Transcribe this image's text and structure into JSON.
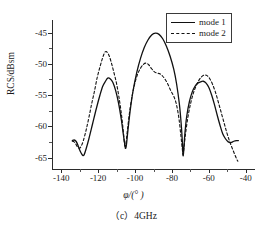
{
  "caption": "（c）4GHz",
  "legend": {
    "position": "top-right",
    "entries": [
      {
        "label": "mode 1",
        "style": "solid"
      },
      {
        "label": "mode 2",
        "style": "dashed"
      }
    ]
  },
  "axes": {
    "x_title": "φ/(° )",
    "y_title": "RCS/dBsm",
    "x_ticks": [
      "-140",
      "-120",
      "-100",
      "-80",
      "-60",
      "-40"
    ],
    "y_ticks": [
      "-45",
      "-50",
      "-55",
      "-60",
      "-65"
    ]
  },
  "chart_data": {
    "type": "line",
    "title": "（c）4GHz",
    "xlabel": "φ/(° )",
    "ylabel": "RCS/dBsm",
    "xlim": [
      -145,
      -35
    ],
    "ylim": [
      -67,
      -43
    ],
    "y_inverted": false,
    "grid": false,
    "legend_position": "top-right",
    "x_ticks": [
      -140,
      -120,
      -100,
      -80,
      -60,
      -40
    ],
    "y_ticks": [
      -45,
      -50,
      -55,
      -60,
      -65
    ],
    "series": [
      {
        "name": "mode 1",
        "style": "solid",
        "color": "#111111",
        "points": [
          [
            -134.0,
            -62.3
          ],
          [
            -133.0,
            -62.2
          ],
          [
            -132.0,
            -62.4
          ],
          [
            -131.0,
            -63.0
          ],
          [
            -130.0,
            -63.8
          ],
          [
            -129.0,
            -64.4
          ],
          [
            -128.2,
            -64.7
          ],
          [
            -127.5,
            -64.5
          ],
          [
            -126.5,
            -63.6
          ],
          [
            -125.0,
            -62.0
          ],
          [
            -123.0,
            -59.6
          ],
          [
            -121.0,
            -57.2
          ],
          [
            -119.0,
            -55.0
          ],
          [
            -117.5,
            -53.6
          ],
          [
            -116.0,
            -52.8
          ],
          [
            -114.8,
            -52.3
          ],
          [
            -113.5,
            -52.4
          ],
          [
            -112.0,
            -53.0
          ],
          [
            -110.5,
            -54.3
          ],
          [
            -109.0,
            -56.2
          ],
          [
            -107.5,
            -58.8
          ],
          [
            -106.3,
            -61.4
          ],
          [
            -105.4,
            -63.2
          ],
          [
            -105.0,
            -63.5
          ],
          [
            -104.6,
            -62.8
          ],
          [
            -103.8,
            -60.5
          ],
          [
            -102.5,
            -57.2
          ],
          [
            -101.0,
            -54.2
          ],
          [
            -99.0,
            -51.3
          ],
          [
            -97.0,
            -49.1
          ],
          [
            -95.0,
            -47.4
          ],
          [
            -93.0,
            -46.2
          ],
          [
            -91.0,
            -45.4
          ],
          [
            -89.0,
            -45.1
          ],
          [
            -87.0,
            -45.3
          ],
          [
            -85.0,
            -46.0
          ],
          [
            -83.0,
            -47.2
          ],
          [
            -81.0,
            -48.8
          ],
          [
            -79.0,
            -50.9
          ],
          [
            -77.5,
            -53.2
          ],
          [
            -76.0,
            -56.4
          ],
          [
            -75.0,
            -59.6
          ],
          [
            -74.3,
            -62.8
          ],
          [
            -74.0,
            -64.7
          ],
          [
            -73.6,
            -63.8
          ],
          [
            -73.0,
            -61.2
          ],
          [
            -72.0,
            -58.4
          ],
          [
            -70.5,
            -56.0
          ],
          [
            -69.0,
            -54.5
          ],
          [
            -67.5,
            -53.6
          ],
          [
            -66.0,
            -53.1
          ],
          [
            -64.5,
            -52.9
          ],
          [
            -63.0,
            -52.8
          ],
          [
            -61.5,
            -53.1
          ],
          [
            -60.0,
            -53.8
          ],
          [
            -58.5,
            -55.0
          ],
          [
            -57.0,
            -56.5
          ],
          [
            -55.5,
            -58.2
          ],
          [
            -54.0,
            -59.8
          ],
          [
            -52.5,
            -61.2
          ],
          [
            -51.0,
            -62.0
          ],
          [
            -49.5,
            -62.5
          ],
          [
            -48.0,
            -62.6
          ],
          [
            -46.5,
            -62.4
          ],
          [
            -45.0,
            -62.3
          ],
          [
            -44.0,
            -62.3
          ]
        ]
      },
      {
        "name": "mode 2",
        "style": "dashed",
        "color": "#111111",
        "points": [
          [
            -134.0,
            -62.4
          ],
          [
            -133.0,
            -62.5
          ],
          [
            -132.0,
            -62.9
          ],
          [
            -131.0,
            -63.4
          ],
          [
            -130.0,
            -63.5
          ],
          [
            -129.2,
            -63.2
          ],
          [
            -128.0,
            -62.3
          ],
          [
            -126.5,
            -60.6
          ],
          [
            -125.0,
            -58.6
          ],
          [
            -123.5,
            -56.4
          ],
          [
            -122.0,
            -54.4
          ],
          [
            -120.5,
            -52.2
          ],
          [
            -119.0,
            -50.5
          ],
          [
            -117.5,
            -49.0
          ],
          [
            -116.2,
            -48.1
          ],
          [
            -115.0,
            -48.2
          ],
          [
            -113.8,
            -48.9
          ],
          [
            -112.5,
            -50.2
          ],
          [
            -111.2,
            -51.7
          ],
          [
            -110.0,
            -53.2
          ],
          [
            -108.8,
            -55.2
          ],
          [
            -107.5,
            -57.8
          ],
          [
            -106.5,
            -60.4
          ],
          [
            -105.8,
            -62.6
          ],
          [
            -105.4,
            -63.5
          ],
          [
            -105.0,
            -62.9
          ],
          [
            -104.2,
            -60.8
          ],
          [
            -103.0,
            -57.8
          ],
          [
            -101.5,
            -55.0
          ],
          [
            -100.0,
            -53.0
          ],
          [
            -98.5,
            -51.6
          ],
          [
            -97.0,
            -50.7
          ],
          [
            -95.5,
            -50.1
          ],
          [
            -94.0,
            -49.9
          ],
          [
            -92.5,
            -50.2
          ],
          [
            -91.0,
            -50.8
          ],
          [
            -89.5,
            -51.3
          ],
          [
            -88.0,
            -51.5
          ],
          [
            -86.5,
            -51.6
          ],
          [
            -85.0,
            -52.0
          ],
          [
            -83.5,
            -52.6
          ],
          [
            -82.0,
            -53.4
          ],
          [
            -80.5,
            -54.4
          ],
          [
            -79.0,
            -55.2
          ],
          [
            -77.5,
            -56.6
          ],
          [
            -76.2,
            -58.8
          ],
          [
            -75.2,
            -61.4
          ],
          [
            -74.4,
            -63.6
          ],
          [
            -74.0,
            -64.5
          ],
          [
            -73.6,
            -63.7
          ],
          [
            -72.8,
            -61.6
          ],
          [
            -71.5,
            -58.8
          ],
          [
            -70.0,
            -56.5
          ],
          [
            -68.5,
            -54.8
          ],
          [
            -67.0,
            -53.6
          ],
          [
            -65.5,
            -52.7
          ],
          [
            -64.0,
            -52.1
          ],
          [
            -62.5,
            -51.8
          ],
          [
            -61.0,
            -51.9
          ],
          [
            -59.5,
            -52.4
          ],
          [
            -58.0,
            -53.3
          ],
          [
            -56.5,
            -54.5
          ],
          [
            -55.0,
            -56.0
          ],
          [
            -53.5,
            -57.6
          ],
          [
            -52.0,
            -59.2
          ],
          [
            -50.5,
            -60.8
          ],
          [
            -49.0,
            -62.2
          ],
          [
            -47.5,
            -63.4
          ],
          [
            -46.0,
            -64.5
          ],
          [
            -45.0,
            -65.2
          ],
          [
            -44.3,
            -65.6
          ]
        ]
      }
    ],
    "annotations": [
      {
        "series": "mode 1",
        "kind": "peak",
        "x": -114.8,
        "y": -52.3
      },
      {
        "series": "mode 1",
        "kind": "peak",
        "x": -89.0,
        "y": -45.1
      },
      {
        "series": "mode 1",
        "kind": "peak",
        "x": -63.0,
        "y": -52.8
      },
      {
        "series": "mode 1",
        "kind": "null",
        "x": -128.2,
        "y": -64.7
      },
      {
        "series": "mode 1",
        "kind": "null",
        "x": -105.0,
        "y": -63.5
      },
      {
        "series": "mode 1",
        "kind": "null",
        "x": -74.0,
        "y": -64.7
      },
      {
        "series": "mode 2",
        "kind": "peak",
        "x": -116.2,
        "y": -48.1
      },
      {
        "series": "mode 2",
        "kind": "peak",
        "x": -94.0,
        "y": -49.9
      },
      {
        "series": "mode 2",
        "kind": "peak",
        "x": -62.5,
        "y": -51.8
      },
      {
        "series": "mode 2",
        "kind": "null",
        "x": -105.4,
        "y": -63.5
      },
      {
        "series": "mode 2",
        "kind": "null",
        "x": -74.0,
        "y": -64.5
      }
    ]
  }
}
